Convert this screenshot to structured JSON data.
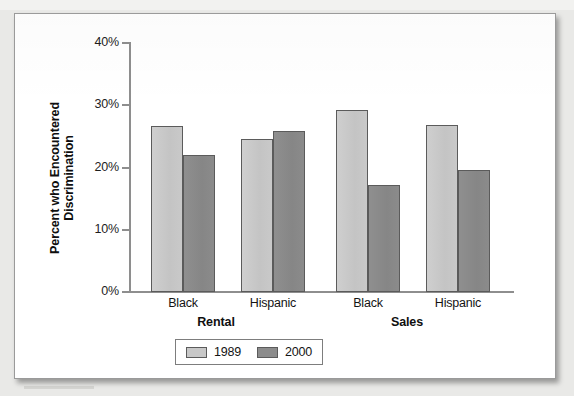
{
  "chart_data": {
    "type": "bar",
    "title": "",
    "xlabel": "",
    "ylabel": "Percent who Encountered Discrimination",
    "ylim": [
      0,
      40
    ],
    "ytick_labels": [
      "0%",
      "10%",
      "20%",
      "30%",
      "40%"
    ],
    "ytick_values": [
      0,
      10,
      20,
      30,
      40
    ],
    "grid": false,
    "legend_position": "bottom-center",
    "categories": [
      "Black",
      "Hispanic",
      "Black",
      "Hispanic"
    ],
    "group_labels": [
      "Rental",
      "Sales"
    ],
    "series": [
      {
        "name": "1989",
        "color": "#c8c8c8",
        "values": [
          26.7,
          24.6,
          29.2,
          26.8
        ]
      },
      {
        "name": "2000",
        "color": "#8c8c8c",
        "values": [
          22.0,
          25.9,
          17.2,
          19.6
        ]
      }
    ]
  },
  "axis": {
    "y_title": "Percent who Encountered Discrimination",
    "ticks": [
      {
        "label": "40%",
        "value": 40
      },
      {
        "label": "30%",
        "value": 30
      },
      {
        "label": "20%",
        "value": 20
      },
      {
        "label": "10%",
        "value": 10
      },
      {
        "label": "0%",
        "value": 0
      }
    ]
  },
  "groups": [
    {
      "name": "Rental",
      "categories": [
        "Black",
        "Hispanic"
      ]
    },
    {
      "name": "Sales",
      "categories": [
        "Black",
        "Hispanic"
      ]
    }
  ],
  "legend": {
    "items": [
      {
        "label": "1989",
        "color": "#c8c8c8"
      },
      {
        "label": "2000",
        "color": "#8c8c8c"
      }
    ]
  }
}
